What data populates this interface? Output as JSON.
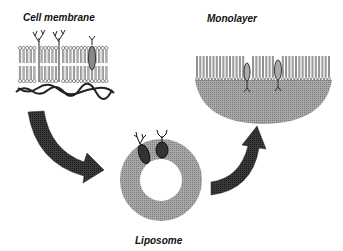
{
  "labels": {
    "cell_membrane": "Cell membrane",
    "monolayer": "Monolayer",
    "liposome": "Liposome"
  },
  "colors": {
    "fill_grey": "#9a9a9a",
    "arrow_dark": "#2b2b2b",
    "line": "#333333",
    "background": "#ffffff"
  },
  "stages": [
    {
      "id": "cell-membrane",
      "description": "Lipid bilayer with embedded glycoproteins and cytoskeletal filaments"
    },
    {
      "id": "liposome",
      "description": "Ring-shaped lipid vesicle with two embedded proteins"
    },
    {
      "id": "monolayer",
      "description": "Lipid monolayer over a grey semicircular support with two embedded proteins"
    }
  ]
}
